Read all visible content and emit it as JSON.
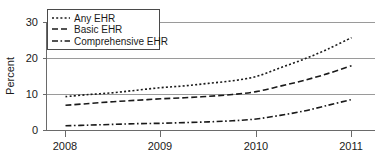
{
  "chart_data": {
    "type": "line",
    "title": "",
    "xlabel": "",
    "ylabel": "Percent",
    "xlim": [
      2008,
      2011
    ],
    "ylim": [
      0,
      30
    ],
    "yticks": [
      0,
      10,
      20,
      30
    ],
    "ytick_labels": [
      "0",
      "10",
      "20",
      "30"
    ],
    "xticks": [
      2008,
      2009,
      2010,
      2011
    ],
    "xtick_labels": [
      "2008",
      "2009",
      "2010",
      "2011"
    ],
    "grid": "horizontal",
    "legend_position": "top-left",
    "x": [
      2008.0,
      2008.25,
      2008.5,
      2008.75,
      2009.0,
      2009.25,
      2009.5,
      2009.75,
      2010.0,
      2010.25,
      2010.5,
      2010.75,
      2011.0
    ],
    "series": [
      {
        "name": "Any EHR",
        "line_style": "dotted",
        "color": "#1a1a1a",
        "values": [
          9.4,
          10.0,
          10.5,
          11.2,
          11.9,
          12.4,
          13.1,
          13.8,
          15.0,
          17.4,
          19.8,
          22.6,
          25.8
        ]
      },
      {
        "name": "Basic EHR",
        "line_style": "dashed",
        "color": "#1a1a1a",
        "values": [
          7.0,
          7.5,
          8.0,
          8.4,
          8.8,
          9.1,
          9.5,
          10.0,
          10.8,
          12.3,
          13.9,
          15.8,
          18.0
        ]
      },
      {
        "name": "Comprehensive EHR",
        "line_style": "dashdot",
        "color": "#1a1a1a",
        "values": [
          1.3,
          1.5,
          1.7,
          1.9,
          2.0,
          2.2,
          2.4,
          2.7,
          3.2,
          4.2,
          5.4,
          7.0,
          8.6
        ]
      }
    ]
  },
  "legend": {
    "entries": [
      {
        "label": "Any EHR"
      },
      {
        "label": "Basic EHR"
      },
      {
        "label": "Comprehensive EHR"
      }
    ]
  },
  "axes": {
    "y_axis_title": "Percent"
  }
}
